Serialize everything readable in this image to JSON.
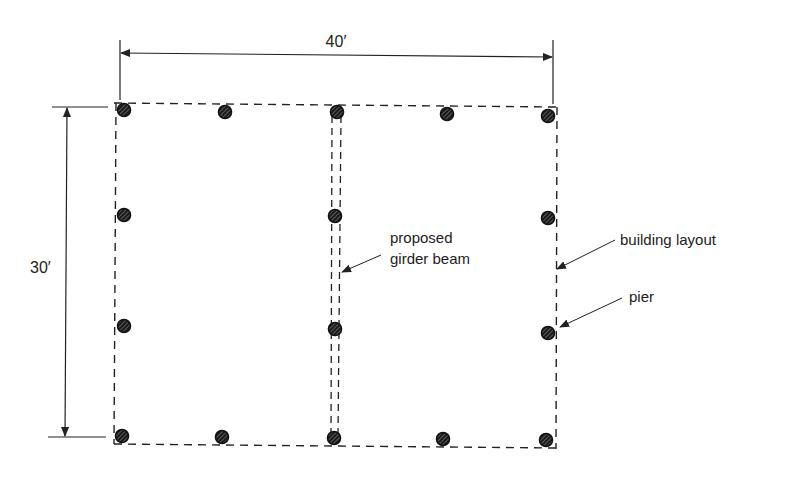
{
  "diagram": {
    "type": "foundation-plan",
    "dimensions": {
      "width_label": "40′",
      "height_label": "30′"
    },
    "labels": {
      "girder": [
        "proposed",
        "girder beam"
      ],
      "layout": "building layout",
      "pier": "pier"
    },
    "colors": {
      "line": "#222222",
      "pier_fill": "#1a1a1a",
      "background": "#ffffff"
    },
    "piers": [
      {
        "row": "top",
        "x": 124,
        "y": 110
      },
      {
        "row": "top",
        "x": 225,
        "y": 112
      },
      {
        "row": "top",
        "x": 337,
        "y": 112
      },
      {
        "row": "top",
        "x": 447,
        "y": 114
      },
      {
        "row": "top",
        "x": 548,
        "y": 116
      },
      {
        "row": "mid1",
        "x": 124,
        "y": 215
      },
      {
        "row": "mid1",
        "x": 335,
        "y": 216
      },
      {
        "row": "mid1",
        "x": 548,
        "y": 218
      },
      {
        "row": "mid2",
        "x": 124,
        "y": 326
      },
      {
        "row": "mid2",
        "x": 335,
        "y": 329
      },
      {
        "row": "mid2",
        "x": 548,
        "y": 333
      },
      {
        "row": "bottom",
        "x": 122,
        "y": 436
      },
      {
        "row": "bottom",
        "x": 222,
        "y": 437
      },
      {
        "row": "bottom",
        "x": 334,
        "y": 438
      },
      {
        "row": "bottom",
        "x": 443,
        "y": 439
      },
      {
        "row": "bottom",
        "x": 546,
        "y": 440
      }
    ]
  }
}
